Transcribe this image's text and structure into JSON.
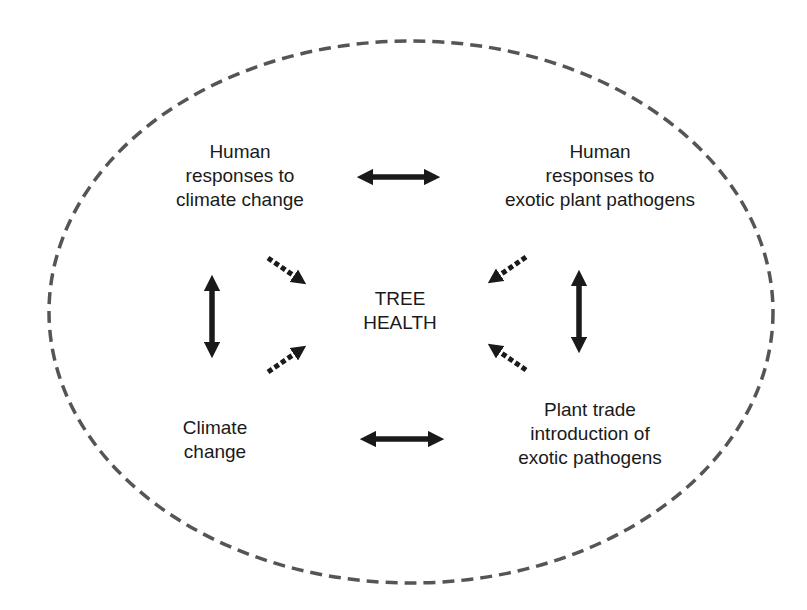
{
  "diagram": {
    "center": {
      "lines": [
        "TREE",
        "HEALTH"
      ]
    },
    "nodes": {
      "top_left": {
        "lines": [
          "Human",
          "responses to",
          "climate change"
        ]
      },
      "top_right": {
        "lines": [
          "Human",
          "responses to",
          "exotic plant pathogens"
        ]
      },
      "bottom_left": {
        "lines": [
          "Climate",
          "change"
        ]
      },
      "bottom_right": {
        "lines": [
          "Plant trade",
          "introduction of",
          "exotic pathogens"
        ]
      }
    },
    "colors": {
      "border": "#555555",
      "arrow": "#1a1a1a",
      "text": "#1a1a1a"
    },
    "boundary": {
      "shape": "ellipse",
      "style": "dashed"
    },
    "edges": [
      {
        "from": "top_left",
        "to": "top_right",
        "type": "bidirectional-solid"
      },
      {
        "from": "bottom_left",
        "to": "bottom_right",
        "type": "bidirectional-solid"
      },
      {
        "from": "top_left",
        "to": "bottom_left",
        "type": "bidirectional-solid"
      },
      {
        "from": "top_right",
        "to": "bottom_right",
        "type": "bidirectional-solid"
      },
      {
        "from": "top_left",
        "to": "center",
        "type": "dashed-arrow"
      },
      {
        "from": "bottom_left",
        "to": "center",
        "type": "dashed-arrow"
      },
      {
        "from": "top_right",
        "to": "center",
        "type": "dashed-arrow"
      },
      {
        "from": "bottom_right",
        "to": "center",
        "type": "dashed-arrow"
      }
    ]
  }
}
